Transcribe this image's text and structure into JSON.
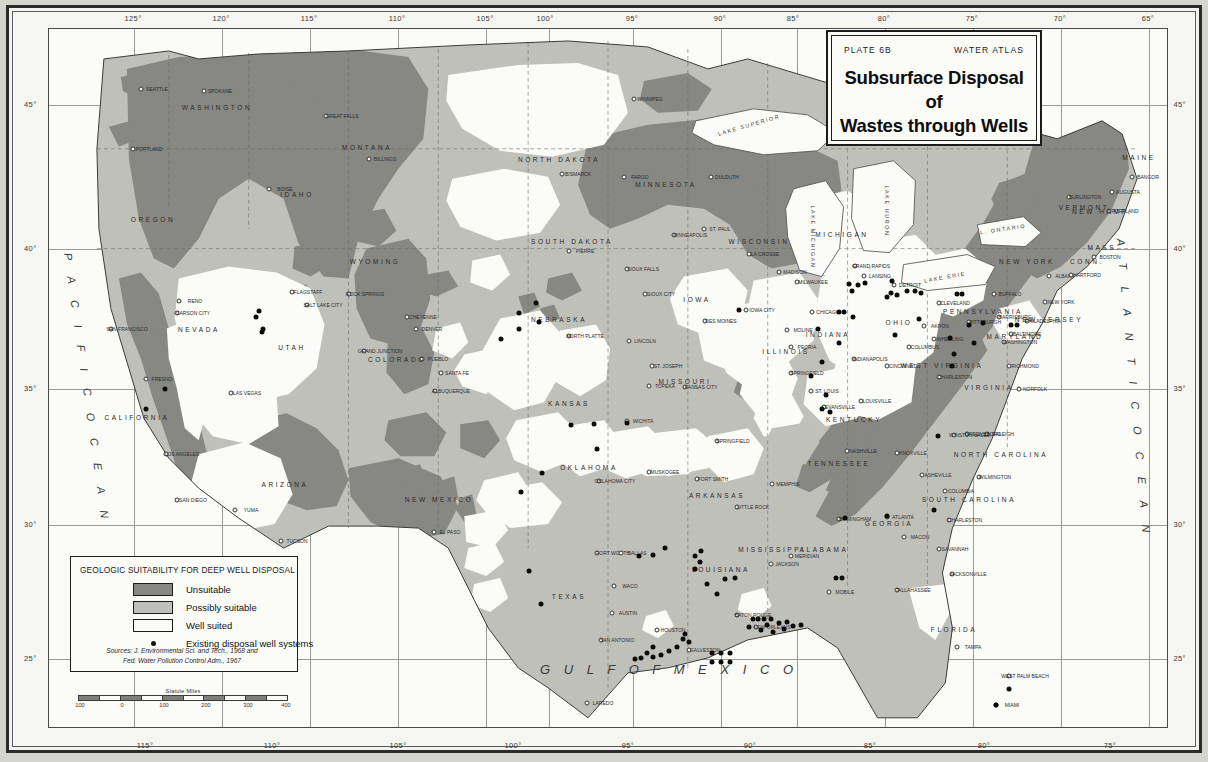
{
  "title_card": {
    "plate": "PLATE 6B",
    "atlas": "WATER ATLAS",
    "title_line1": "Subsurface Disposal of",
    "title_line2": "Wastes through Wells"
  },
  "legend": {
    "heading": "GEOLOGIC SUITABILITY FOR DEEP WELL DISPOSAL",
    "items": [
      {
        "label": "Unsuitable",
        "swatch": "dark-gray",
        "color": "#878783"
      },
      {
        "label": "Possibly suitable",
        "swatch": "light-gray",
        "color": "#c0c0bb"
      },
      {
        "label": "Well suited",
        "swatch": "white",
        "color": "#fbfbf8"
      },
      {
        "label": "Existing disposal well systems",
        "swatch": "black-dot",
        "color": "#0b0b0b"
      }
    ],
    "source_line1": "Sources: J. Environmental Sci. and Tech., 1968 and",
    "source_line2": "Fed. Water Pollution Control Adm., 1967"
  },
  "scale_bar": {
    "title": "Statute Miles",
    "ticks": [
      "100",
      "0",
      "100",
      "200",
      "300",
      "400"
    ]
  },
  "graticule": {
    "top_labels": [
      "125°",
      "120°",
      "115°",
      "110°",
      "105°",
      "100°",
      "95°",
      "90°",
      "85°",
      "80°",
      "75°",
      "70°",
      "65°"
    ],
    "bottom_labels": [
      "115°",
      "110°",
      "105°",
      "100°",
      "95°",
      "90°",
      "85°",
      "80°",
      "75°"
    ],
    "left_labels": [
      "45°",
      "40°",
      "35°",
      "30°",
      "25°"
    ],
    "right_labels": [
      "45°",
      "40°",
      "35°",
      "30°",
      "25°"
    ]
  },
  "oceans": [
    {
      "name": "PACIFIC OCEAN",
      "letters": "P A C I F I C   O C E A N"
    },
    {
      "name": "ATLANTIC OCEAN",
      "letters": "A T L A N T I C   O C E A N"
    },
    {
      "name": "GULF OF MEXICO",
      "letters": "G U L F   O F   M E X I C O"
    }
  ],
  "lakes": [
    "LAKE SUPERIOR",
    "LAKE MICHIGAN",
    "LAKE HURON",
    "LAKE ERIE",
    "L. ONTARIO"
  ],
  "states": [
    {
      "name": "WASHINGTON",
      "x": 168,
      "y": 78
    },
    {
      "name": "OREGON",
      "x": 104,
      "y": 190
    },
    {
      "name": "MONTANA",
      "x": 318,
      "y": 118
    },
    {
      "name": "IDAHO",
      "x": 248,
      "y": 165
    },
    {
      "name": "WYOMING",
      "x": 326,
      "y": 232
    },
    {
      "name": "NEVADA",
      "x": 150,
      "y": 300
    },
    {
      "name": "UTAH",
      "x": 243,
      "y": 318
    },
    {
      "name": "CALIFORNIA",
      "x": 88,
      "y": 388
    },
    {
      "name": "COLORADO",
      "x": 348,
      "y": 330
    },
    {
      "name": "ARIZONA",
      "x": 236,
      "y": 455
    },
    {
      "name": "NEW MEXICO",
      "x": 390,
      "y": 470
    },
    {
      "name": "NORTH DAKOTA",
      "x": 510,
      "y": 130
    },
    {
      "name": "SOUTH DAKOTA",
      "x": 523,
      "y": 212
    },
    {
      "name": "NEBRASKA",
      "x": 510,
      "y": 290
    },
    {
      "name": "KANSAS",
      "x": 520,
      "y": 374
    },
    {
      "name": "OKLAHOMA",
      "x": 540,
      "y": 438
    },
    {
      "name": "TEXAS",
      "x": 520,
      "y": 567
    },
    {
      "name": "MINNESOTA",
      "x": 617,
      "y": 155
    },
    {
      "name": "IOWA",
      "x": 648,
      "y": 270
    },
    {
      "name": "MISSOURI",
      "x": 636,
      "y": 352
    },
    {
      "name": "ARKANSAS",
      "x": 668,
      "y": 466
    },
    {
      "name": "LOUISIANA",
      "x": 672,
      "y": 540
    },
    {
      "name": "WISCONSIN",
      "x": 710,
      "y": 212
    },
    {
      "name": "ILLINOIS",
      "x": 737,
      "y": 322
    },
    {
      "name": "MISSISSIPPI",
      "x": 723,
      "y": 520
    },
    {
      "name": "MICHIGAN",
      "x": 793,
      "y": 205
    },
    {
      "name": "INDIANA",
      "x": 779,
      "y": 305
    },
    {
      "name": "KENTUCKY",
      "x": 805,
      "y": 390
    },
    {
      "name": "TENNESSEE",
      "x": 790,
      "y": 434
    },
    {
      "name": "ALABAMA",
      "x": 775,
      "y": 520
    },
    {
      "name": "OHIO",
      "x": 850,
      "y": 293
    },
    {
      "name": "GEORGIA",
      "x": 840,
      "y": 494
    },
    {
      "name": "FLORIDA",
      "x": 905,
      "y": 600
    },
    {
      "name": "PENNSYLVANIA",
      "x": 934,
      "y": 282
    },
    {
      "name": "WEST VIRGINIA",
      "x": 893,
      "y": 336
    },
    {
      "name": "VIRGINIA",
      "x": 940,
      "y": 358
    },
    {
      "name": "NORTH CAROLINA",
      "x": 952,
      "y": 425
    },
    {
      "name": "SOUTH CAROLINA",
      "x": 920,
      "y": 470
    },
    {
      "name": "NEW YORK",
      "x": 978,
      "y": 232
    },
    {
      "name": "MARYLAND",
      "x": 966,
      "y": 307
    },
    {
      "name": "NEW JERSEY",
      "x": 1000,
      "y": 290
    },
    {
      "name": "VERMONT",
      "x": 1035,
      "y": 178
    },
    {
      "name": "NEW HAMP.",
      "x": 1053,
      "y": 182
    },
    {
      "name": "MASS.",
      "x": 1055,
      "y": 218
    },
    {
      "name": "CONN.",
      "x": 1038,
      "y": 232
    },
    {
      "name": "MAINE",
      "x": 1090,
      "y": 128
    }
  ],
  "cities": [
    {
      "name": "SEATTLE",
      "x": 92,
      "y": 60
    },
    {
      "name": "SPOKANE",
      "x": 155,
      "y": 62
    },
    {
      "name": "PORTLAND",
      "x": 84,
      "y": 120
    },
    {
      "name": "GREAT FALLS",
      "x": 277,
      "y": 87
    },
    {
      "name": "BILLINGS",
      "x": 320,
      "y": 130
    },
    {
      "name": "BOISE",
      "x": 220,
      "y": 160
    },
    {
      "name": "RENO",
      "x": 130,
      "y": 272
    },
    {
      "name": "CARSON CITY",
      "x": 128,
      "y": 284
    },
    {
      "name": "SAN FRANCISCO",
      "x": 62,
      "y": 300
    },
    {
      "name": "FRESNO",
      "x": 97,
      "y": 350
    },
    {
      "name": "LOS ANGELES",
      "x": 117,
      "y": 425
    },
    {
      "name": "SAN DIEGO",
      "x": 128,
      "y": 471
    },
    {
      "name": "YUMA",
      "x": 186,
      "y": 481
    },
    {
      "name": "TUCSON",
      "x": 232,
      "y": 512
    },
    {
      "name": "LAS VEGAS",
      "x": 182,
      "y": 364
    },
    {
      "name": "SALT LAKE CITY",
      "x": 258,
      "y": 276
    },
    {
      "name": "FLAGSTAFF",
      "x": 243,
      "y": 263
    },
    {
      "name": "ROCK SPRINGS",
      "x": 300,
      "y": 265
    },
    {
      "name": "CHEYENNE",
      "x": 358,
      "y": 288
    },
    {
      "name": "DENVER",
      "x": 367,
      "y": 300
    },
    {
      "name": "GRAND JUNCTION",
      "x": 315,
      "y": 322
    },
    {
      "name": "PUEBLO",
      "x": 373,
      "y": 330
    },
    {
      "name": "ALBUQUERQUE",
      "x": 386,
      "y": 362
    },
    {
      "name": "SANTA FE",
      "x": 392,
      "y": 344
    },
    {
      "name": "EL PASO",
      "x": 385,
      "y": 503
    },
    {
      "name": "BISMARCK",
      "x": 513,
      "y": 145
    },
    {
      "name": "FARGO",
      "x": 575,
      "y": 148
    },
    {
      "name": "WINNIPEG",
      "x": 585,
      "y": 70
    },
    {
      "name": "PIERRE",
      "x": 520,
      "y": 222
    },
    {
      "name": "SIOUX FALLS",
      "x": 578,
      "y": 240
    },
    {
      "name": "SIOUX CITY",
      "x": 596,
      "y": 265
    },
    {
      "name": "NORTH PLATTE",
      "x": 520,
      "y": 307
    },
    {
      "name": "LINCOLN",
      "x": 580,
      "y": 312
    },
    {
      "name": "DES MOINES",
      "x": 656,
      "y": 292
    },
    {
      "name": "IOWA CITY",
      "x": 697,
      "y": 281
    },
    {
      "name": "ST. JOSEPH",
      "x": 603,
      "y": 337
    },
    {
      "name": "TOPEKA",
      "x": 600,
      "y": 357
    },
    {
      "name": "KANSAS CITY",
      "x": 636,
      "y": 358
    },
    {
      "name": "WICHITA",
      "x": 578,
      "y": 392
    },
    {
      "name": "SPRINGFIELD",
      "x": 668,
      "y": 412
    },
    {
      "name": "DULDUTH",
      "x": 662,
      "y": 148
    },
    {
      "name": "MINNEAPOLIS",
      "x": 625,
      "y": 206
    },
    {
      "name": "ST. PAUL",
      "x": 655,
      "y": 200
    },
    {
      "name": "LA CROSSE",
      "x": 700,
      "y": 225
    },
    {
      "name": "MADISON",
      "x": 730,
      "y": 243
    },
    {
      "name": "MILWAUKEE",
      "x": 748,
      "y": 253
    },
    {
      "name": "CHICAGO",
      "x": 763,
      "y": 283
    },
    {
      "name": "MOLINE",
      "x": 738,
      "y": 301
    },
    {
      "name": "PEORIA",
      "x": 742,
      "y": 318
    },
    {
      "name": "SPRINGFIELD",
      "x": 742,
      "y": 344
    },
    {
      "name": "ST. LOUIS",
      "x": 762,
      "y": 362
    },
    {
      "name": "EVANSVILLE",
      "x": 775,
      "y": 378
    },
    {
      "name": "NASHVILLE",
      "x": 798,
      "y": 422
    },
    {
      "name": "MEMPHIS",
      "x": 723,
      "y": 455
    },
    {
      "name": "LITTLE ROCK",
      "x": 688,
      "y": 478
    },
    {
      "name": "FORT SMITH",
      "x": 648,
      "y": 450
    },
    {
      "name": "MUSKOGEE",
      "x": 600,
      "y": 443
    },
    {
      "name": "OKLAHOMA CITY",
      "x": 550,
      "y": 452
    },
    {
      "name": "FORT WORTH",
      "x": 548,
      "y": 524
    },
    {
      "name": "DALLAS",
      "x": 572,
      "y": 524
    },
    {
      "name": "WACO",
      "x": 565,
      "y": 557
    },
    {
      "name": "AUSTIN",
      "x": 563,
      "y": 584
    },
    {
      "name": "SAN ANTONIO",
      "x": 552,
      "y": 611
    },
    {
      "name": "HOUSTON",
      "x": 608,
      "y": 601
    },
    {
      "name": "GALVESTON",
      "x": 640,
      "y": 621
    },
    {
      "name": "LAREDO",
      "x": 538,
      "y": 674
    },
    {
      "name": "BATON ROUGE",
      "x": 688,
      "y": 586
    },
    {
      "name": "NEW ORLEANS",
      "x": 707,
      "y": 598
    },
    {
      "name": "JACKSON",
      "x": 722,
      "y": 535
    },
    {
      "name": "MERIDIAN",
      "x": 742,
      "y": 527
    },
    {
      "name": "MOBILE",
      "x": 780,
      "y": 563
    },
    {
      "name": "BIRMINGHAM",
      "x": 790,
      "y": 490
    },
    {
      "name": "ATLANTA",
      "x": 838,
      "y": 488
    },
    {
      "name": "MACON",
      "x": 855,
      "y": 508
    },
    {
      "name": "SAVANNAH",
      "x": 890,
      "y": 520
    },
    {
      "name": "CHARLESTON",
      "x": 900,
      "y": 491
    },
    {
      "name": "COLUMBIA",
      "x": 896,
      "y": 462
    },
    {
      "name": "WILMINGTON",
      "x": 930,
      "y": 448
    },
    {
      "name": "RALEIGH",
      "x": 938,
      "y": 405
    },
    {
      "name": "GREENSBORO",
      "x": 918,
      "y": 405
    },
    {
      "name": "WINSTON SALEM",
      "x": 905,
      "y": 406
    },
    {
      "name": "ASHEVILLE",
      "x": 873,
      "y": 446
    },
    {
      "name": "KNOXVILLE",
      "x": 848,
      "y": 424
    },
    {
      "name": "LOUISVILLE",
      "x": 812,
      "y": 372
    },
    {
      "name": "CINCINNATI",
      "x": 838,
      "y": 337
    },
    {
      "name": "INDIANAPOLIS",
      "x": 805,
      "y": 330
    },
    {
      "name": "COLUMBUS",
      "x": 860,
      "y": 318
    },
    {
      "name": "CHARLESTON",
      "x": 890,
      "y": 348
    },
    {
      "name": "WHEELING",
      "x": 885,
      "y": 310
    },
    {
      "name": "AKRON",
      "x": 875,
      "y": 297
    },
    {
      "name": "CLEVELAND",
      "x": 890,
      "y": 274
    },
    {
      "name": "PITTSBURGH",
      "x": 920,
      "y": 293
    },
    {
      "name": "DETROIT",
      "x": 845,
      "y": 256
    },
    {
      "name": "LANSING",
      "x": 815,
      "y": 247
    },
    {
      "name": "GRAND RAPIDS",
      "x": 806,
      "y": 237
    },
    {
      "name": "BUFFALO",
      "x": 945,
      "y": 265
    },
    {
      "name": "HARRISBURG",
      "x": 950,
      "y": 288
    },
    {
      "name": "PHILADELPHIA",
      "x": 978,
      "y": 292
    },
    {
      "name": "BALTIMORE",
      "x": 962,
      "y": 305
    },
    {
      "name": "WASHINGTON",
      "x": 955,
      "y": 313
    },
    {
      "name": "RICHMOND",
      "x": 960,
      "y": 337
    },
    {
      "name": "NORFOLK",
      "x": 970,
      "y": 360
    },
    {
      "name": "NEW YORK",
      "x": 996,
      "y": 273
    },
    {
      "name": "ALBANY",
      "x": 1000,
      "y": 247
    },
    {
      "name": "HARTFORD",
      "x": 1022,
      "y": 246
    },
    {
      "name": "BOSTON",
      "x": 1045,
      "y": 228
    },
    {
      "name": "PORTLAND",
      "x": 1060,
      "y": 182
    },
    {
      "name": "AUGUSTA",
      "x": 1063,
      "y": 163
    },
    {
      "name": "BANGOR",
      "x": 1083,
      "y": 148
    },
    {
      "name": "BURLINGTON",
      "x": 1020,
      "y": 168
    },
    {
      "name": "JACKSONVILLE",
      "x": 903,
      "y": 545
    },
    {
      "name": "TALLAHASSEE",
      "x": 848,
      "y": 561
    },
    {
      "name": "TAMPA",
      "x": 908,
      "y": 618
    },
    {
      "name": "MIAMI",
      "x": 947,
      "y": 676
    },
    {
      "name": "WEST PALM BEACH",
      "x": 960,
      "y": 647
    },
    {
      "name": "KEY WEST",
      "x": 930,
      "y": 718
    }
  ],
  "well_sites": [
    {
      "x": 210,
      "y": 282
    },
    {
      "x": 207,
      "y": 288
    },
    {
      "x": 214,
      "y": 300
    },
    {
      "x": 213,
      "y": 303
    },
    {
      "x": 116,
      "y": 360
    },
    {
      "x": 97,
      "y": 380
    },
    {
      "x": 487,
      "y": 274
    },
    {
      "x": 470,
      "y": 284
    },
    {
      "x": 490,
      "y": 293
    },
    {
      "x": 470,
      "y": 300
    },
    {
      "x": 452,
      "y": 310
    },
    {
      "x": 493,
      "y": 444
    },
    {
      "x": 472,
      "y": 463
    },
    {
      "x": 480,
      "y": 542
    },
    {
      "x": 492,
      "y": 575
    },
    {
      "x": 522,
      "y": 396
    },
    {
      "x": 545,
      "y": 395
    },
    {
      "x": 578,
      "y": 394
    },
    {
      "x": 548,
      "y": 420
    },
    {
      "x": 690,
      "y": 281
    },
    {
      "x": 769,
      "y": 300
    },
    {
      "x": 790,
      "y": 314
    },
    {
      "x": 773,
      "y": 333
    },
    {
      "x": 762,
      "y": 347
    },
    {
      "x": 777,
      "y": 366
    },
    {
      "x": 781,
      "y": 383
    },
    {
      "x": 773,
      "y": 380
    },
    {
      "x": 800,
      "y": 255
    },
    {
      "x": 803,
      "y": 262
    },
    {
      "x": 809,
      "y": 256
    },
    {
      "x": 816,
      "y": 254
    },
    {
      "x": 804,
      "y": 288
    },
    {
      "x": 790,
      "y": 283
    },
    {
      "x": 795,
      "y": 283
    },
    {
      "x": 838,
      "y": 268
    },
    {
      "x": 842,
      "y": 264
    },
    {
      "x": 848,
      "y": 266
    },
    {
      "x": 843,
      "y": 252
    },
    {
      "x": 858,
      "y": 262
    },
    {
      "x": 866,
      "y": 262
    },
    {
      "x": 872,
      "y": 264
    },
    {
      "x": 908,
      "y": 265
    },
    {
      "x": 913,
      "y": 265
    },
    {
      "x": 920,
      "y": 296
    },
    {
      "x": 934,
      "y": 294
    },
    {
      "x": 903,
      "y": 337
    },
    {
      "x": 901,
      "y": 309
    },
    {
      "x": 905,
      "y": 325
    },
    {
      "x": 925,
      "y": 314
    },
    {
      "x": 962,
      "y": 296
    },
    {
      "x": 968,
      "y": 296
    },
    {
      "x": 889,
      "y": 407
    },
    {
      "x": 838,
      "y": 487
    },
    {
      "x": 796,
      "y": 489
    },
    {
      "x": 616,
      "y": 519
    },
    {
      "x": 604,
      "y": 526
    },
    {
      "x": 590,
      "y": 527
    },
    {
      "x": 652,
      "y": 522
    },
    {
      "x": 646,
      "y": 527
    },
    {
      "x": 651,
      "y": 533
    },
    {
      "x": 646,
      "y": 540
    },
    {
      "x": 658,
      "y": 555
    },
    {
      "x": 676,
      "y": 550
    },
    {
      "x": 686,
      "y": 549
    },
    {
      "x": 668,
      "y": 565
    },
    {
      "x": 704,
      "y": 590
    },
    {
      "x": 709,
      "y": 590
    },
    {
      "x": 715,
      "y": 590
    },
    {
      "x": 722,
      "y": 590
    },
    {
      "x": 718,
      "y": 596
    },
    {
      "x": 712,
      "y": 601
    },
    {
      "x": 724,
      "y": 603
    },
    {
      "x": 730,
      "y": 594
    },
    {
      "x": 735,
      "y": 600
    },
    {
      "x": 738,
      "y": 593
    },
    {
      "x": 744,
      "y": 597
    },
    {
      "x": 752,
      "y": 596
    },
    {
      "x": 700,
      "y": 598
    },
    {
      "x": 636,
      "y": 605
    },
    {
      "x": 634,
      "y": 610
    },
    {
      "x": 640,
      "y": 613
    },
    {
      "x": 628,
      "y": 618
    },
    {
      "x": 620,
      "y": 622
    },
    {
      "x": 612,
      "y": 626
    },
    {
      "x": 604,
      "y": 628
    },
    {
      "x": 598,
      "y": 624
    },
    {
      "x": 592,
      "y": 629
    },
    {
      "x": 586,
      "y": 630
    },
    {
      "x": 604,
      "y": 618
    },
    {
      "x": 663,
      "y": 624
    },
    {
      "x": 672,
      "y": 624
    },
    {
      "x": 681,
      "y": 624
    },
    {
      "x": 663,
      "y": 633
    },
    {
      "x": 672,
      "y": 633
    },
    {
      "x": 681,
      "y": 633
    },
    {
      "x": 787,
      "y": 549
    },
    {
      "x": 793,
      "y": 549
    },
    {
      "x": 960,
      "y": 660
    },
    {
      "x": 947,
      "y": 676
    },
    {
      "x": 885,
      "y": 481
    },
    {
      "x": 846,
      "y": 306
    },
    {
      "x": 870,
      "y": 290
    }
  ]
}
